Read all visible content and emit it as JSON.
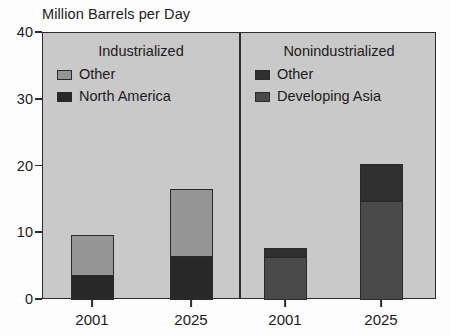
{
  "chart_data": {
    "type": "bar",
    "title": "Million Barrels per Day",
    "xlabel": "",
    "ylabel": "Million Barrels per Day",
    "ylim": [
      0,
      40
    ],
    "yticks": [
      0,
      10,
      20,
      30,
      40
    ],
    "ytick_labels": [
      "0",
      "10",
      "20",
      "30",
      "40"
    ],
    "grid": false,
    "stacked": true,
    "legend_position": "inside-top-left-of-each-panel",
    "panels": [
      {
        "name": "Industrialized",
        "categories": [
          "2001",
          "2025"
        ],
        "series": [
          {
            "name": "North America",
            "color": "#282828",
            "values": [
              3.4,
              6.2
            ]
          },
          {
            "name": "Other",
            "color": "#959595",
            "values": [
              6.4,
              10.4
            ]
          }
        ],
        "totals": [
          9.8,
          16.6
        ]
      },
      {
        "name": "Nonindustrialized",
        "categories": [
          "2001",
          "2025"
        ],
        "series": [
          {
            "name": "Developing Asia",
            "color": "#4a4a4a",
            "values": [
              6.2,
              14.6
            ]
          },
          {
            "name": "Other",
            "color": "#303030",
            "values": [
              1.6,
              5.8
            ]
          }
        ],
        "totals": [
          7.8,
          20.4
        ]
      }
    ]
  },
  "colors": {
    "plot_background": "#c9c9c9",
    "page_background": "#fdfdfd",
    "axis": "#2c2c2c",
    "text": "#1b1b1b",
    "industrialized_other": "#959595",
    "industrialized_north_america": "#282828",
    "nonindustrialized_other": "#303030",
    "nonindustrialized_developing_asia": "#4a4a4a"
  },
  "axes": {
    "y_ticks": [
      {
        "label": "40",
        "value": 40
      },
      {
        "label": "30",
        "value": 30
      },
      {
        "label": "20",
        "value": 20
      },
      {
        "label": "10",
        "value": 10
      },
      {
        "label": "0",
        "value": 0
      }
    ],
    "x_ticks": [
      {
        "label": "2001"
      },
      {
        "label": "2025"
      },
      {
        "label": "2001"
      },
      {
        "label": "2025"
      }
    ]
  },
  "panel_headers": [
    {
      "label": "Industrialized"
    },
    {
      "label": "Nonindustrialized"
    }
  ],
  "legends": {
    "left": [
      {
        "label": "Other",
        "swatch": "#959595"
      },
      {
        "label": "North America",
        "swatch": "#282828"
      }
    ],
    "right": [
      {
        "label": "Other",
        "swatch": "#303030"
      },
      {
        "label": "Developing Asia",
        "swatch": "#4a4a4a"
      }
    ]
  }
}
